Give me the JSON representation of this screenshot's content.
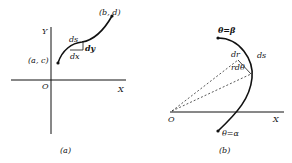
{
  "figure_a": {
    "caption": "(a)",
    "y_axis_label": "Y",
    "x_axis_label": "X",
    "origin_label": "O",
    "start_point_label": "(a, c)",
    "end_point_label": "(b, d)",
    "ds_label": "ds",
    "dx_label": "dx",
    "dy_label": "dy"
  },
  "figure_b": {
    "caption": "(b)",
    "x_axis_label": "X",
    "origin_label": "O",
    "top_point_label": "θ=β",
    "bottom_point_label": "θ=α",
    "dr_label": "dr",
    "rdtheta_label": "rdθ",
    "ds_label": "ds"
  },
  "colors": {
    "ink": "#111111",
    "background": "#ffffff"
  }
}
